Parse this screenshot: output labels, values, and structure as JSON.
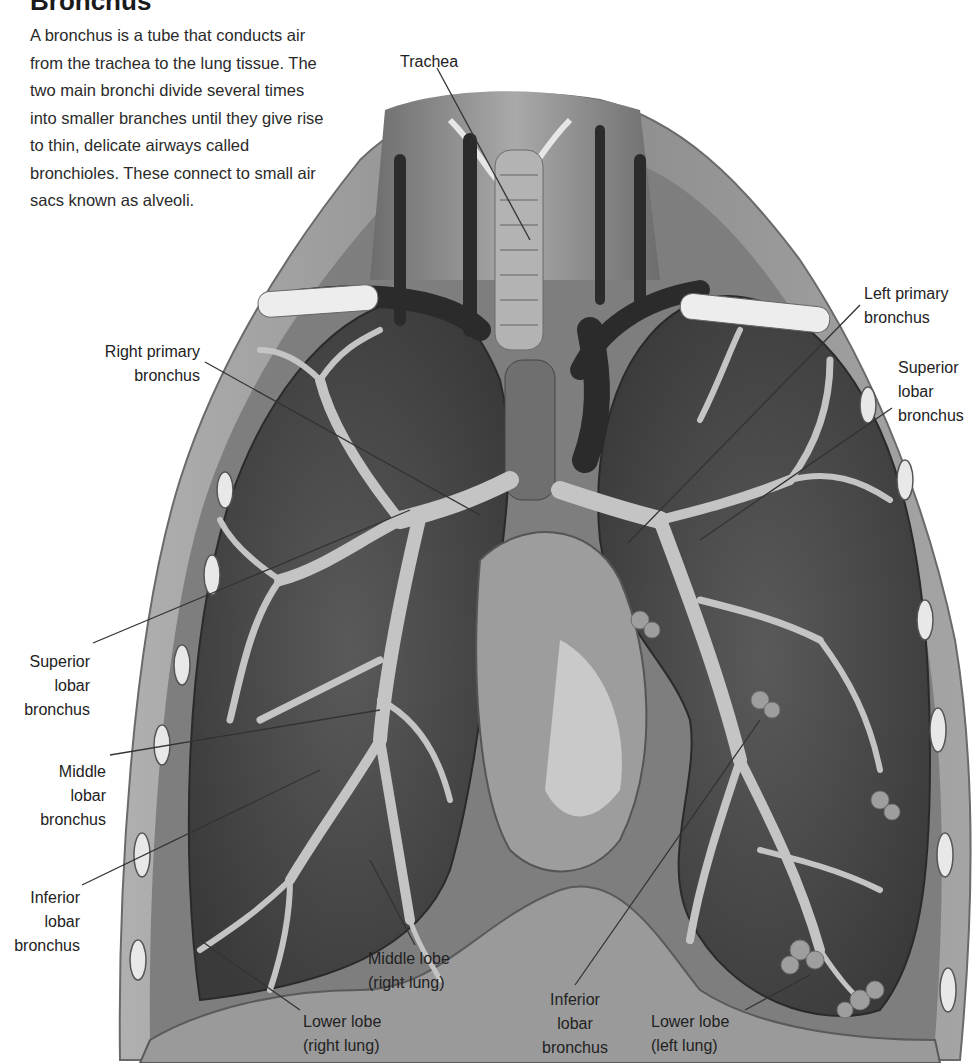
{
  "header": {
    "title": "Bronchus",
    "intro": "A bronchus is a tube that conducts air from the trachea to the lung tissue. The two main bronchi divide several times into smaller branches until they give rise to thin, delicate airways called bronchioles. These connect to small air sacs known as alveoli."
  },
  "labels": {
    "trachea": "Trachea",
    "left_primary_bronchus": "Left primary\nbronchus",
    "superior_lobar_bronchus_left": "Superior\nlobar\nbronchus",
    "right_primary_bronchus": "Right primary\nbronchus",
    "superior_lobar_bronchus_right": "Superior\nlobar\nbronchus",
    "middle_lobar_bronchus": "Middle\nlobar\nbronchus",
    "inferior_lobar_bronchus_right": "Inferior\nlobar\nbronchus",
    "middle_lobe_right_lung": "Middle lobe\n(right lung)",
    "lower_lobe_right_lung": "Lower lobe\n(right lung)",
    "inferior_lobar_bronchus_left": "Inferior\nlobar\nbronchus",
    "lower_lobe_left_lung": "Lower lobe\n(left lung)"
  },
  "colors": {
    "background": "#ffffff",
    "text": "#222222",
    "leader_line": "#333333",
    "lung_tissue": "#4a4a4a",
    "bronchi": "#b8b8b8",
    "vessels": "#2e2e2e",
    "chest_wall": "#8c8c8c"
  }
}
